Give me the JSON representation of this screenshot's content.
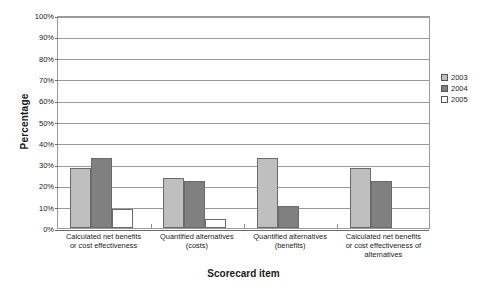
{
  "chart_data": {
    "type": "bar",
    "title": "",
    "xlabel": "Scorecard item",
    "ylabel": "Percentage",
    "categories": [
      "Calculated net benefits or cost effectiveness",
      "Quantified alternatives (costs)",
      "Quantified alternatives (benefits)",
      "Calculated net benefits or cost effectiveness of alternatives"
    ],
    "category_lines": [
      [
        "Calculated net benefits",
        "or cost effectiveness"
      ],
      [
        "Quantified alternatives",
        "(costs)"
      ],
      [
        "Quantified alternatives",
        "(benefits)"
      ],
      [
        "Calculated net benefits",
        "or cost effectiveness of",
        "alternatives"
      ]
    ],
    "series": [
      {
        "name": "2003",
        "color": "#bfbfbf",
        "values": [
          28,
          23.5,
          33,
          28
        ]
      },
      {
        "name": "2004",
        "color": "#808080",
        "values": [
          33,
          22,
          10.5,
          22
        ]
      },
      {
        "name": "2005",
        "color": "#ffffff",
        "values": [
          9,
          4,
          0,
          0
        ]
      }
    ],
    "ylim": [
      0,
      100
    ],
    "ytick_step": 10,
    "ytick_labels": [
      "0%",
      "10%",
      "20%",
      "30%",
      "40%",
      "50%",
      "60%",
      "70%",
      "80%",
      "90%",
      "100%"
    ],
    "grid": true,
    "legend_position": "right",
    "axis_color": "#9a9a9a",
    "bar_border_color": "#6b6b6b"
  }
}
